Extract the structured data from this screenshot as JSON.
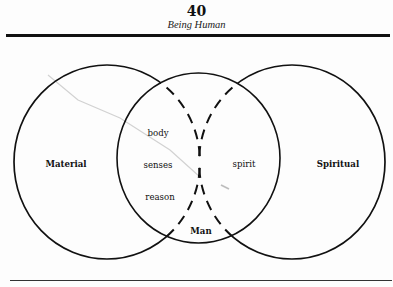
{
  "header": {
    "page_number": "40",
    "running_title": "Being Human"
  },
  "diagram": {
    "circles": [
      {
        "id": "left",
        "label": "Material",
        "style": "solid outside, dashed inside middle circle"
      },
      {
        "id": "middle",
        "label": "Man",
        "style": "solid"
      },
      {
        "id": "right",
        "label": "Spiritual",
        "style": "solid outside, dashed inside middle circle"
      }
    ],
    "overlap_left_terms": [
      "body",
      "senses",
      "reason"
    ],
    "overlap_right_terms": [
      "spirit"
    ],
    "colors": {
      "ink": "#111111",
      "paper": "#fdfdfd",
      "scratch": "#cfcfcf"
    }
  }
}
